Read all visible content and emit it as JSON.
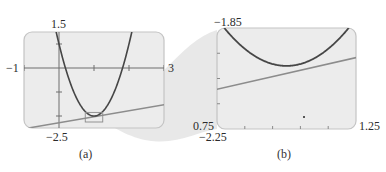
{
  "chart_data": [
    {
      "type": "line",
      "panel": "a",
      "caption": "(a)",
      "title": "",
      "xlabel": "",
      "ylabel": "",
      "xlim": [
        -1,
        3
      ],
      "ylim": [
        -2.5,
        1.5
      ],
      "xtick_step": 1,
      "ytick_step": 1,
      "grid": false,
      "axis_labels": {
        "xmin": "−1",
        "xmax": "3",
        "ymax": "1.5",
        "ymin": "−2.5"
      },
      "series": [
        {
          "name": "parabola",
          "expression": "y = 3x^2 - 6x + 1",
          "x": [
            -0.15,
            0,
            0.25,
            0.5,
            0.75,
            1,
            1.25,
            1.5,
            1.75,
            2,
            2.15
          ],
          "values": [
            1.97,
            1.0,
            -0.31,
            -1.25,
            -1.81,
            -2.0,
            -1.81,
            -1.25,
            -0.31,
            1.0,
            1.97
          ]
        },
        {
          "name": "line",
          "expression": "y = 0.25x - 2.28",
          "x": [
            -1,
            3
          ],
          "values": [
            -2.53,
            -1.53
          ]
        }
      ],
      "annotations": [
        {
          "type": "zoom-box",
          "xlim": [
            0.75,
            1.25
          ],
          "ylim": [
            -2.25,
            -1.85
          ]
        }
      ]
    },
    {
      "type": "line",
      "panel": "b",
      "caption": "(b)",
      "title": "",
      "xlabel": "",
      "ylabel": "",
      "xlim": [
        0.75,
        1.25
      ],
      "ylim": [
        -2.25,
        -1.85
      ],
      "xtick_step": 0.1,
      "ytick_step": 0.1,
      "grid": false,
      "axis_labels": {
        "xmin": "0.75",
        "xmax": "1.25",
        "ymax": "−1.85",
        "ymin": "−2.25"
      },
      "series": [
        {
          "name": "parabola",
          "expression": "y = 3x^2 - 6x + 1",
          "x": [
            0.75,
            0.85,
            0.95,
            1.0,
            1.05,
            1.15,
            1.25
          ],
          "values": [
            -1.8125,
            -1.9325,
            -1.9925,
            -2.0,
            -1.9925,
            -1.9325,
            -1.8125
          ]
        },
        {
          "name": "line",
          "expression": "y = 0.25x - 2.28",
          "x": [
            0.75,
            1.25
          ],
          "values": [
            -2.0925,
            -1.9675
          ]
        }
      ]
    }
  ],
  "colors": {
    "panel_fill": "#ececec",
    "panel_border": "#c4c4c4",
    "parabola": "#464646",
    "line": "#8c8c8c",
    "axis": "#6e6e6e",
    "cone": "#e4e4e4"
  },
  "labels": {
    "a": {
      "xmin": "−1",
      "xmax": "3",
      "ymax": "1.5",
      "ymin": "−2.5",
      "caption": "(a)"
    },
    "b": {
      "xmin": "0.75",
      "xmax": "1.25",
      "ymax": "−1.85",
      "ymin": "−2.25",
      "caption": "(b)"
    }
  }
}
